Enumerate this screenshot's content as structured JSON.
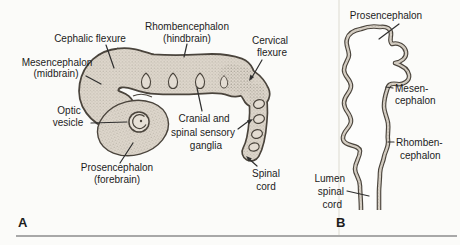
{
  "figure": {
    "type": "embryology-diagram",
    "colors": {
      "background": "#fbfbf9",
      "ink": "#1c1c1c",
      "tube_outline": "#4a443c",
      "tube_fill": "#ded7cc",
      "bottom_rule": "#8d8d8d"
    },
    "panel_a": {
      "letter": "A",
      "labels": {
        "cephalic_flexure": "Cephalic flexure",
        "rhombencephalon_line1": "Rhombencephalon",
        "rhombencephalon_line2": "(hindbrain)",
        "cervical_line1": "Cervical",
        "cervical_line2": "flexure",
        "mesencephalon_line1": "Mesencephalon",
        "mesencephalon_line2": "(midbrain)",
        "optic_line1": "Optic",
        "optic_line2": "vesicle",
        "ganglia_line1": "Cranial and",
        "ganglia_line2": "spinal sensory",
        "ganglia_line3": "ganglia",
        "prosencephalon_line1": "Prosencephalon",
        "prosencephalon_line2": "(forebrain)",
        "spinal_line1": "Spinal",
        "spinal_line2": "cord"
      }
    },
    "panel_b": {
      "letter": "B",
      "labels": {
        "prosencephalon": "Prosencephalon",
        "mesencephalon_line1": "Mesen-",
        "mesencephalon_line2": "cephalon",
        "rhombencephalon_line1": "Rhomben-",
        "rhombencephalon_line2": "cephalon",
        "lumen_line1": "Lumen",
        "lumen_line2": "spinal",
        "lumen_line3": "cord"
      }
    }
  }
}
